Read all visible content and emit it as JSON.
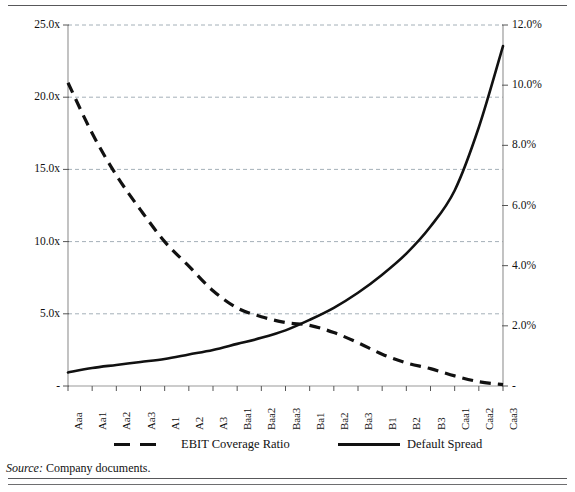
{
  "figure": {
    "source_label": "Source:",
    "source_text": " Company documents."
  },
  "legend": {
    "items": [
      {
        "label": "EBIT Coverage Ratio",
        "style": "dashed",
        "color": "#111111"
      },
      {
        "label": "Default Spread",
        "style": "solid",
        "color": "#111111"
      }
    ]
  },
  "chart_data": {
    "type": "line",
    "title": "",
    "xlabel": "",
    "grid": true,
    "legend_position": "bottom",
    "categories": [
      "Aaa",
      "Aa1",
      "Aa2",
      "Aa3",
      "A1",
      "A2",
      "A3",
      "Baa1",
      "Baa2",
      "Baa3",
      "Ba1",
      "Ba2",
      "Ba3",
      "B1",
      "B2",
      "B3",
      "Caa1",
      "Caa2",
      "Caa3"
    ],
    "axes": {
      "left": {
        "label": "",
        "ylim": [
          0,
          25
        ],
        "ticks": [
          0,
          5,
          10,
          15,
          20,
          25
        ],
        "ticklabels": [
          "-",
          "5.0x",
          "10.0x",
          "15.0x",
          "20.0x",
          "25.0x"
        ]
      },
      "right": {
        "label": "",
        "ylim": [
          0,
          12
        ],
        "ticks": [
          0,
          2,
          4,
          6,
          8,
          10,
          12
        ],
        "ticklabels": [
          "-",
          "2.0%",
          "4.0%",
          "6.0%",
          "8.0%",
          "10.0%",
          "12.0%"
        ]
      }
    },
    "series": [
      {
        "name": "EBIT Coverage Ratio",
        "axis": "left",
        "style": "dashed",
        "color": "#111111",
        "units": "x",
        "values": [
          21.0,
          17.5,
          14.6,
          12.2,
          10.0,
          8.3,
          6.6,
          5.4,
          4.8,
          4.4,
          4.2,
          3.7,
          3.0,
          2.2,
          1.6,
          1.2,
          0.7,
          0.3,
          0.1
        ]
      },
      {
        "name": "Default Spread",
        "axis": "right",
        "style": "solid",
        "color": "#111111",
        "units": "%",
        "values": [
          0.45,
          0.6,
          0.7,
          0.8,
          0.9,
          1.05,
          1.2,
          1.4,
          1.6,
          1.85,
          2.2,
          2.6,
          3.1,
          3.7,
          4.4,
          5.3,
          6.5,
          8.6,
          11.3
        ]
      }
    ]
  }
}
